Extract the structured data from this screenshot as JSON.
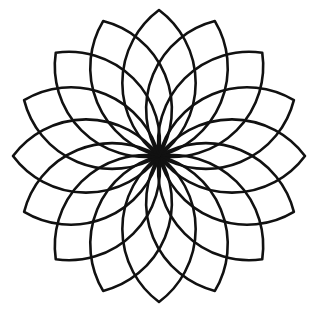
{
  "rosette": {
    "petal_count": 16,
    "center": [
      159,
      156
    ],
    "petal_length": 146,
    "petal_arc_radius": 91,
    "stroke_width": 2.6,
    "stroke_color": "#111111",
    "background": "#ffffff",
    "start_angle_deg": 0
  }
}
